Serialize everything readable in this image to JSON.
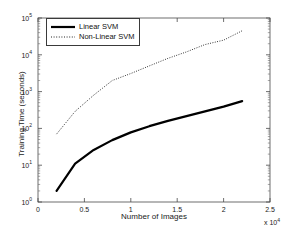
{
  "chart_data": {
    "type": "line",
    "title": "",
    "xlabel": "Number of Images",
    "ylabel": "Training Time (seconds)",
    "x_multiplier": "x 10",
    "x_multiplier_exp": "4",
    "xlim": [
      0,
      25000
    ],
    "ylim": [
      1,
      100000
    ],
    "yscale": "log",
    "xscale": "linear",
    "grid": false,
    "legend_position": "upper left",
    "xticks": [
      {
        "value": 0,
        "label": "0"
      },
      {
        "value": 5000,
        "label": "0.5"
      },
      {
        "value": 10000,
        "label": "1"
      },
      {
        "value": 15000,
        "label": "1.5"
      },
      {
        "value": 20000,
        "label": "2"
      },
      {
        "value": 25000,
        "label": "2.5"
      }
    ],
    "yticks": [
      {
        "value": 1,
        "mantissa": "10",
        "exp": "0"
      },
      {
        "value": 10,
        "mantissa": "10",
        "exp": "1"
      },
      {
        "value": 100,
        "mantissa": "10",
        "exp": "2"
      },
      {
        "value": 1000,
        "mantissa": "10",
        "exp": "3"
      },
      {
        "value": 10000,
        "mantissa": "10",
        "exp": "4"
      },
      {
        "value": 100000,
        "mantissa": "10",
        "exp": "5"
      }
    ],
    "series": [
      {
        "name": "Linear SVM",
        "style": "solid",
        "color": "#000000",
        "width": 2.2,
        "x": [
          2000,
          4000,
          6000,
          8000,
          10000,
          12000,
          14000,
          16000,
          18000,
          20000,
          22000
        ],
        "y": [
          2.0,
          11.0,
          26.0,
          48.0,
          78.0,
          115.0,
          160.0,
          215.0,
          290.0,
          390.0,
          550.0
        ]
      },
      {
        "name": "Non-Linear SVM",
        "style": "dotted",
        "color": "#222222",
        "width": 1.0,
        "x": [
          2000,
          4000,
          6000,
          8000,
          10000,
          12000,
          14000,
          16000,
          18000,
          20000,
          22000
        ],
        "y": [
          70.0,
          290.0,
          800.0,
          2000.0,
          3100.0,
          5000.0,
          8000.0,
          12000.0,
          19000.0,
          25000.0,
          45000.0
        ]
      }
    ]
  },
  "legend": {
    "items": [
      {
        "label": "Linear SVM"
      },
      {
        "label": "Non-Linear SVM"
      }
    ]
  },
  "axes": {
    "box_left_px": 38,
    "box_right_px": 270,
    "box_top_px": 18,
    "box_bottom_px": 202
  }
}
